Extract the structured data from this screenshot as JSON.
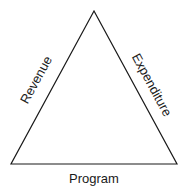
{
  "diagram": {
    "type": "triangle",
    "stroke_color": "#1a1a1a",
    "background": "#ffffff",
    "vertices": {
      "apex": [
        94,
        11
      ],
      "bottom_left": [
        11,
        164
      ],
      "bottom_right": [
        177,
        164
      ]
    },
    "labels": {
      "left_side": "Revenue",
      "right_side": "Expenditure",
      "bottom_side": "Program"
    }
  }
}
